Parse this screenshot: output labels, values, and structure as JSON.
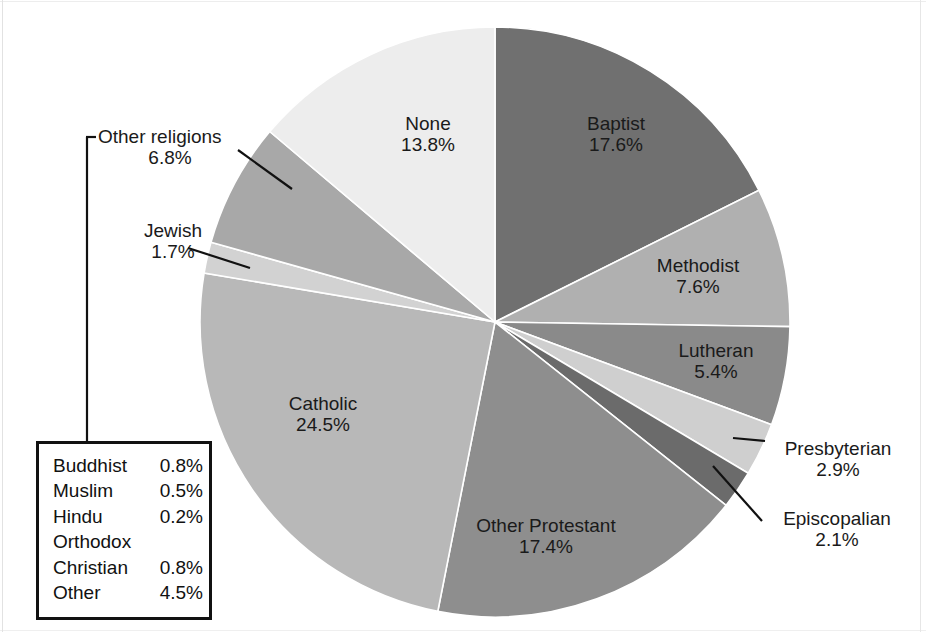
{
  "chart_data": {
    "type": "pie",
    "title": "",
    "unit": "%",
    "start_angle_deg": 0,
    "direction": "clockwise",
    "center_px": [
      495,
      322
    ],
    "radius_px": 295,
    "categories": [
      "Baptist",
      "Methodist",
      "Lutheran",
      "Presbyterian",
      "Episcopalian",
      "Other Protestant",
      "Catholic",
      "Jewish",
      "Other religions",
      "None"
    ],
    "values": [
      17.6,
      7.6,
      5.4,
      2.9,
      2.1,
      17.4,
      24.5,
      1.7,
      6.8,
      13.8
    ],
    "colors": [
      "#707070",
      "#b0b0b0",
      "#8a8a8a",
      "#cfcfcf",
      "#6b6b6b",
      "#8e8e8e",
      "#b8b8b8",
      "#d2d2d2",
      "#a8a8a8",
      "#ededed"
    ],
    "slices": [
      {
        "label": "Baptist",
        "value": 17.6,
        "value_text": "17.6%",
        "color": "#707070",
        "label_placement": "inside"
      },
      {
        "label": "Methodist",
        "value": 7.6,
        "value_text": "7.6%",
        "color": "#b0b0b0",
        "label_placement": "inside"
      },
      {
        "label": "Lutheran",
        "value": 5.4,
        "value_text": "5.4%",
        "color": "#8a8a8a",
        "label_placement": "inside"
      },
      {
        "label": "Presbyterian",
        "value": 2.9,
        "value_text": "2.9%",
        "color": "#cfcfcf",
        "label_placement": "outside-leader"
      },
      {
        "label": "Episcopalian",
        "value": 2.1,
        "value_text": "2.1%",
        "color": "#6b6b6b",
        "label_placement": "outside-leader"
      },
      {
        "label": "Other Protestant",
        "value": 17.4,
        "value_text": "17.4%",
        "color": "#8e8e8e",
        "label_placement": "inside"
      },
      {
        "label": "Catholic",
        "value": 24.5,
        "value_text": "24.5%",
        "color": "#b8b8b8",
        "label_placement": "inside"
      },
      {
        "label": "Jewish",
        "value": 1.7,
        "value_text": "1.7%",
        "color": "#d2d2d2",
        "label_placement": "outside-leader"
      },
      {
        "label": "Other religions",
        "value": 6.8,
        "value_text": "6.8%",
        "color": "#a8a8a8",
        "label_placement": "outside-leader"
      },
      {
        "label": "None",
        "value": 13.8,
        "value_text": "13.8%",
        "color": "#ededed",
        "label_placement": "inside"
      }
    ],
    "breakdown_note": "Other religions 6.8% breakdown",
    "breakdown": [
      {
        "name": "Buddhist",
        "value": 0.8,
        "value_text": "0.8%"
      },
      {
        "name": "Muslim",
        "value": 0.5,
        "value_text": "0.5%"
      },
      {
        "name": "Hindu",
        "value": 0.2,
        "value_text": "0.2%"
      },
      {
        "name": "Orthodox",
        "value": null,
        "value_text": ""
      },
      {
        "name": "Christian",
        "value": 0.8,
        "value_text": "0.8%"
      },
      {
        "name": "Other",
        "value": 4.5,
        "value_text": "4.5%"
      }
    ]
  },
  "labels": {
    "baptist_name": "Baptist",
    "baptist_pct": "17.6%",
    "methodist_name": "Methodist",
    "methodist_pct": "7.6%",
    "lutheran_name": "Lutheran",
    "lutheran_pct": "5.4%",
    "presbyterian_name": "Presbyterian",
    "presbyterian_pct": "2.9%",
    "episcopalian_name": "Episcopalian",
    "episcopalian_pct": "2.1%",
    "other_protestant_name": "Other Protestant",
    "other_protestant_pct": "17.4%",
    "catholic_name": "Catholic",
    "catholic_pct": "24.5%",
    "jewish_name": "Jewish",
    "jewish_pct": "1.7%",
    "other_religions_name": "Other religions",
    "other_religions_pct": "6.8%",
    "none_name": "None",
    "none_pct": "13.8%"
  },
  "legend": {
    "rows": [
      {
        "name": "Buddhist",
        "value": "0.8%"
      },
      {
        "name": "Muslim",
        "value": "0.5%"
      },
      {
        "name": "Hindu",
        "value": "0.2%"
      },
      {
        "name": "Orthodox",
        "value": ""
      },
      {
        "name": "Christian",
        "value": "0.8%"
      },
      {
        "name": "Other",
        "value": "4.5%"
      }
    ]
  },
  "style": {
    "stroke": "#ffffff",
    "text_color": "#111111",
    "leader_color": "#111111",
    "box_border": "#111111"
  }
}
